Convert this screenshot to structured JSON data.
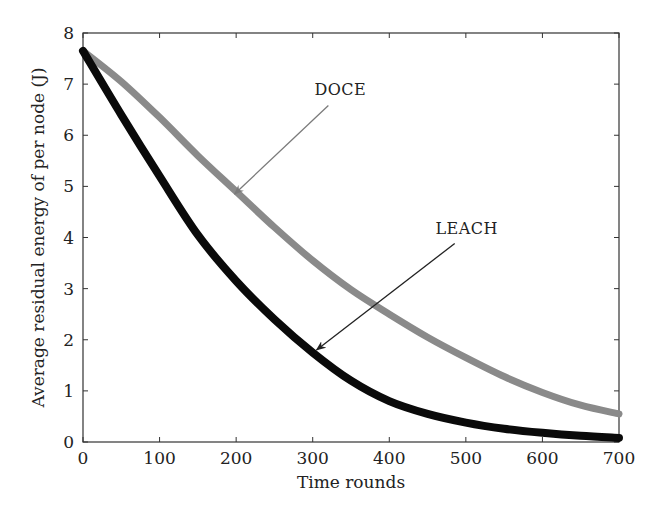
{
  "chart_data": {
    "type": "line",
    "title": "",
    "xlabel": "Time rounds",
    "ylabel": "Average residual energy of per node (J)",
    "xlim": [
      0,
      700
    ],
    "ylim": [
      0,
      8
    ],
    "xticks": [
      0,
      100,
      200,
      300,
      400,
      500,
      600,
      700
    ],
    "yticks": [
      0,
      1,
      2,
      3,
      4,
      5,
      6,
      7,
      8
    ],
    "grid": false,
    "legend": "none (inline arrow annotations)",
    "x": [
      0,
      50,
      100,
      150,
      200,
      250,
      300,
      350,
      400,
      450,
      500,
      550,
      600,
      650,
      700
    ],
    "series": [
      {
        "name": "DOCE",
        "color": "#8a8a8a",
        "values": [
          7.65,
          7.05,
          6.35,
          5.6,
          4.9,
          4.2,
          3.55,
          2.98,
          2.5,
          2.05,
          1.65,
          1.28,
          0.97,
          0.72,
          0.55
        ]
      },
      {
        "name": "LEACH",
        "color": "#0a0a0a",
        "values": [
          7.65,
          6.4,
          5.2,
          4.05,
          3.15,
          2.4,
          1.75,
          1.2,
          0.8,
          0.55,
          0.38,
          0.26,
          0.18,
          0.12,
          0.08
        ]
      }
    ],
    "annotations": [
      {
        "text": "DOCE",
        "points_to": "DOCE",
        "label_xy": [
          310,
          6.7
        ],
        "arrow_tip_xy": [
          198,
          4.85
        ]
      },
      {
        "text": "LEACH",
        "points_to": "LEACH",
        "label_xy": [
          475,
          4.0
        ],
        "arrow_tip_xy": [
          305,
          1.8
        ]
      }
    ]
  }
}
